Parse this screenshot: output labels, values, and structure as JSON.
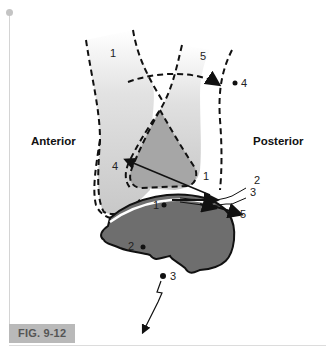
{
  "figure": {
    "caption": "FIG. 9-12",
    "orientation_labels": {
      "left": "Anterior",
      "right": "Posterior"
    },
    "bone_labels": {
      "upper_left": "1",
      "upper_right": "5",
      "point_4_upper": "4",
      "inner_4": "4",
      "contact_1": "1",
      "talus_1": "1",
      "talus_2": "2",
      "below_3": "3",
      "arrow_2": "2",
      "arrow_3": "3",
      "arrow_5": "5"
    },
    "colors": {
      "light_shade": "#cfcfcf",
      "mid_shade": "#a9a9a9",
      "talus_fill": "#6e6e6e",
      "outline": "#111111",
      "caption_bg": "#b9b9b9"
    }
  }
}
